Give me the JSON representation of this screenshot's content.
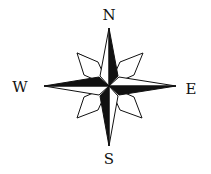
{
  "diagram": {
    "type": "compass-rose",
    "colors": {
      "fill": "#111111",
      "outline": "#111111",
      "background": "#ffffff"
    },
    "labels": {
      "north": "N",
      "east": "E",
      "south": "S",
      "west": "W"
    }
  }
}
